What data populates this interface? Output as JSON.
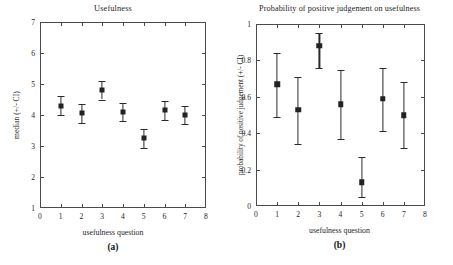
{
  "figure": {
    "panels": [
      {
        "letter": "(a)",
        "title": "Usefulness",
        "xlabel": "usefulness question",
        "ylabel": "median (+/- CI)"
      },
      {
        "letter": "(b)",
        "title": "Probability of positive judgement on usefulness",
        "xlabel": "usefulness question",
        "ylabel": "probability of positive judgement (+/- CI)"
      }
    ]
  },
  "chart_data": [
    {
      "type": "scatter",
      "title": "Usefulness",
      "xlabel": "usefulness question",
      "ylabel": "median (+/- CI)",
      "xlim": [
        0,
        8
      ],
      "ylim": [
        1,
        7
      ],
      "xticks": [
        0,
        1,
        2,
        3,
        4,
        5,
        6,
        7,
        8
      ],
      "yticks": [
        1,
        2,
        3,
        4,
        5,
        6,
        7
      ],
      "xtick_labels": [
        "0",
        "1",
        "2",
        "3",
        "4",
        "5",
        "6",
        "7",
        "8"
      ],
      "ytick_labels": [
        "1",
        "2",
        "3",
        "4",
        "5",
        "6",
        "7"
      ],
      "grid": false,
      "legend": "none",
      "errorbars": true,
      "x": [
        1,
        2,
        3,
        4,
        5,
        6,
        7
      ],
      "values": [
        4.3,
        4.05,
        4.8,
        4.1,
        3.25,
        4.15,
        4.0
      ],
      "y_low": [
        4.0,
        3.75,
        4.5,
        3.8,
        2.95,
        3.85,
        3.7
      ],
      "y_high": [
        4.6,
        4.35,
        5.1,
        4.4,
        3.55,
        4.45,
        4.3
      ]
    },
    {
      "type": "scatter",
      "title": "Probability of positive judgement on usefulness",
      "xlabel": "usefulness question",
      "ylabel": "probability of positive judgement (+/- CI)",
      "xlim": [
        0,
        8
      ],
      "ylim": [
        0,
        1
      ],
      "xticks": [
        0,
        1,
        2,
        3,
        4,
        5,
        6,
        7,
        8
      ],
      "yticks": [
        0,
        0.2,
        0.4,
        0.6,
        0.8,
        1
      ],
      "xtick_labels": [
        "0",
        "1",
        "2",
        "3",
        "4",
        "5",
        "6",
        "7",
        "8"
      ],
      "ytick_labels": [
        "0",
        "0.2",
        "0.4",
        "0.6",
        "0.8",
        "1"
      ],
      "grid": false,
      "legend": "none",
      "errorbars": true,
      "x": [
        1,
        2,
        3,
        4,
        5,
        6,
        7
      ],
      "values": [
        0.67,
        0.53,
        0.88,
        0.56,
        0.13,
        0.59,
        0.5
      ],
      "y_low": [
        0.49,
        0.34,
        0.76,
        0.37,
        0.05,
        0.41,
        0.32
      ],
      "y_high": [
        0.84,
        0.71,
        0.95,
        0.75,
        0.27,
        0.76,
        0.68
      ]
    }
  ],
  "colors": {
    "marker": "#222222",
    "axis": "#4a4a4a",
    "text": "#1d1d1d",
    "background": "#ffffff"
  }
}
